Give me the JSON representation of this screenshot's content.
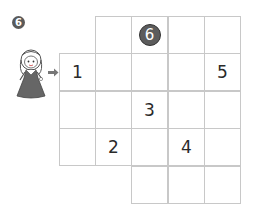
{
  "puzzle": {
    "number_badge": "6",
    "colors": {
      "grid_line": "#c8c8c8",
      "badge": "#5a5a5a",
      "circled_clue": "#5c5c5c",
      "text": "#2a2a2a"
    },
    "grid": {
      "cell_width": 36.5,
      "cell_height": 37.6,
      "origin_x": 60,
      "origin_y": 17,
      "rows": [
        {
          "cells": [
            {
              "col": 1,
              "value": ""
            },
            {
              "col": 2,
              "value": "6",
              "circled": true
            },
            {
              "col": 3,
              "value": ""
            },
            {
              "col": 4,
              "value": ""
            }
          ]
        },
        {
          "cells": [
            {
              "col": 0,
              "value": "1"
            },
            {
              "col": 1,
              "value": ""
            },
            {
              "col": 2,
              "value": ""
            },
            {
              "col": 3,
              "value": ""
            },
            {
              "col": 4,
              "value": "5"
            }
          ]
        },
        {
          "cells": [
            {
              "col": 0,
              "value": ""
            },
            {
              "col": 1,
              "value": ""
            },
            {
              "col": 2,
              "value": "3"
            },
            {
              "col": 3,
              "value": ""
            },
            {
              "col": 4,
              "value": ""
            }
          ]
        },
        {
          "cells": [
            {
              "col": 0,
              "value": ""
            },
            {
              "col": 1,
              "value": "2"
            },
            {
              "col": 2,
              "value": ""
            },
            {
              "col": 3,
              "value": "4"
            },
            {
              "col": 4,
              "value": ""
            }
          ]
        },
        {
          "cells": [
            {
              "col": 2,
              "value": ""
            },
            {
              "col": 3,
              "value": ""
            },
            {
              "col": 4,
              "value": ""
            }
          ]
        }
      ]
    },
    "start_icon": "girl-character-icon",
    "start_pointer": "arrow-right-icon"
  }
}
